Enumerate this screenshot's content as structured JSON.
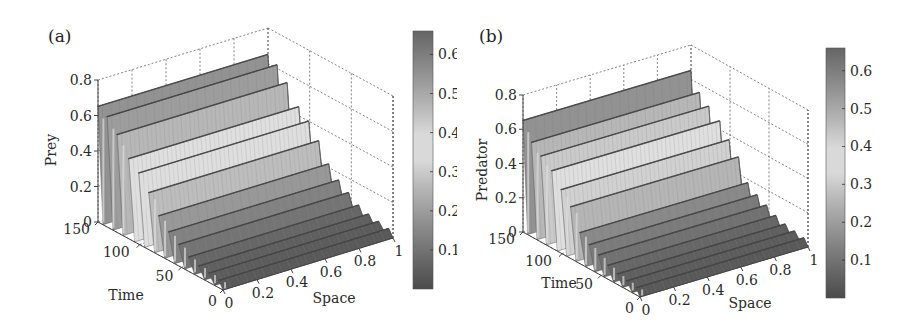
{
  "chart_data": [
    {
      "panel_label": "(a)",
      "type": "surface3d",
      "title": "",
      "xlabel": "Space",
      "ylabel": "Time",
      "zlabel": "Prey",
      "xlim": [
        0,
        1
      ],
      "ylim": [
        0,
        150
      ],
      "zlim": [
        0,
        0.8
      ],
      "x_ticks": [
        "0",
        "0.2",
        "0.4",
        "0.6",
        "0.8",
        "1"
      ],
      "y_ticks": [
        "0",
        "50",
        "100",
        "150"
      ],
      "z_ticks": [
        "0",
        "0.2",
        "0.4",
        "0.6",
        "0.8"
      ],
      "colorbar": {
        "ticks": [
          "0.1",
          "0.2",
          "0.3",
          "0.4",
          "0.5",
          "0.6"
        ],
        "range": [
          0.0,
          0.66
        ]
      },
      "grid": true,
      "description": "Spatially uniform ridges (parallel to Space axis) oscillating in Time with decaying amplitude toward t=0; peaks near 0.65 at t≈150.",
      "ridges": [
        {
          "time": 150,
          "peak": 0.65
        },
        {
          "time": 138,
          "peak": 0.62
        },
        {
          "time": 126,
          "peak": 0.55
        },
        {
          "time": 112,
          "peak": 0.45
        },
        {
          "time": 100,
          "peak": 0.4
        },
        {
          "time": 88,
          "peak": 0.32
        },
        {
          "time": 76,
          "peak": 0.22
        },
        {
          "time": 64,
          "peak": 0.16
        },
        {
          "time": 52,
          "peak": 0.12
        },
        {
          "time": 40,
          "peak": 0.08
        },
        {
          "time": 28,
          "peak": 0.06
        },
        {
          "time": 16,
          "peak": 0.05
        },
        {
          "time": 4,
          "peak": 0.04
        }
      ]
    },
    {
      "panel_label": "(b)",
      "type": "surface3d",
      "title": "",
      "xlabel": "Space",
      "ylabel": "Time",
      "zlabel": "Predator",
      "xlim": [
        0,
        1
      ],
      "ylim": [
        0,
        150
      ],
      "zlim": [
        0,
        0.8
      ],
      "x_ticks": [
        "0",
        "0.2",
        "0.4",
        "0.6",
        "0.8",
        "1"
      ],
      "y_ticks": [
        "0",
        "50",
        "100",
        "150"
      ],
      "z_ticks": [
        "0",
        "0.2",
        "0.4",
        "0.6",
        "0.8"
      ],
      "colorbar": {
        "ticks": [
          "0.1",
          "0.2",
          "0.3",
          "0.4",
          "0.5",
          "0.6"
        ],
        "range": [
          0.0,
          0.66
        ]
      },
      "grid": true,
      "description": "Spatially uniform ridges (parallel to Space axis) oscillating in Time with decaying amplitude toward t=0; peaks near 0.65 at t≈150.",
      "ridges": [
        {
          "time": 150,
          "peak": 0.65
        },
        {
          "time": 138,
          "peak": 0.55
        },
        {
          "time": 126,
          "peak": 0.5
        },
        {
          "time": 112,
          "peak": 0.45
        },
        {
          "time": 100,
          "peak": 0.37
        },
        {
          "time": 88,
          "peak": 0.3
        },
        {
          "time": 76,
          "peak": 0.18
        },
        {
          "time": 64,
          "peak": 0.14
        },
        {
          "time": 52,
          "peak": 0.11
        },
        {
          "time": 40,
          "peak": 0.08
        },
        {
          "time": 28,
          "peak": 0.06
        },
        {
          "time": 16,
          "peak": 0.05
        },
        {
          "time": 4,
          "peak": 0.04
        }
      ]
    }
  ]
}
